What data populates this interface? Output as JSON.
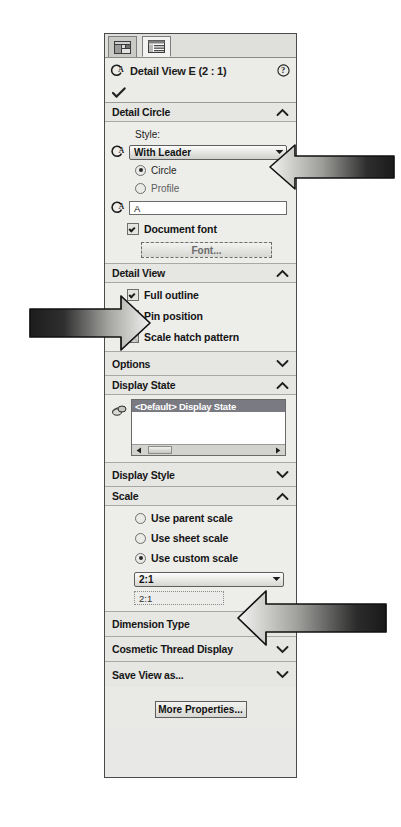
{
  "window": {
    "title": "Detail View E (2 : 1)"
  },
  "tabs": [
    {
      "name": "property-manager-tab",
      "icon": "property-manager-icon",
      "active": false
    },
    {
      "name": "configuration-manager-tab",
      "icon": "list-table-icon",
      "active": true
    }
  ],
  "titlebar": {
    "icon": "detail-view-icon",
    "title": "Detail View E (2 : 1)",
    "help_icon": "help-question-icon"
  },
  "ok_button": {
    "icon": "checkmark-icon",
    "label": "OK"
  },
  "sections": {
    "detail_circle": {
      "label": "Detail Circle",
      "expanded": true,
      "chevron": "chevron-up-icon",
      "style_label": "Style:",
      "style_value": "With Leader",
      "style_icon": "detail-circle-icon",
      "radio_circle": "Circle",
      "radio_profile": "Profile",
      "radio_selected": "Circle",
      "label_field_icon": "detail-label-icon",
      "label_field_value": "A",
      "document_font_label": "Document font",
      "document_font_checked": true,
      "font_button": "Font..."
    },
    "detail_view": {
      "label": "Detail View",
      "expanded": true,
      "chevron": "chevron-up-icon",
      "full_outline_label": "Full outline",
      "full_outline_checked": true,
      "pin_position_label": "Pin position",
      "pin_position_checked": true,
      "scale_hatch_label": "Scale hatch pattern",
      "scale_hatch_checked": false
    },
    "options": {
      "label": "Options",
      "expanded": false,
      "chevron": "chevron-down-icon"
    },
    "display_state": {
      "label": "Display State",
      "expanded": true,
      "chevron": "chevron-up-icon",
      "icon": "display-state-icon",
      "selected_item": "<Default> Display State",
      "scroll_left_icon": "scroll-left-arrow-icon",
      "scroll_right_icon": "scroll-right-arrow-icon"
    },
    "display_style": {
      "label": "Display Style",
      "expanded": false,
      "chevron": "chevron-down-icon"
    },
    "scale": {
      "label": "Scale",
      "expanded": true,
      "chevron": "chevron-up-icon",
      "use_parent_scale": "Use parent scale",
      "use_sheet_scale": "Use sheet scale",
      "use_custom_scale": "Use custom scale",
      "selected": "Use custom scale",
      "scale_combo_value": "2:1",
      "scale_text_value": "2:1"
    },
    "dimension_type": {
      "label": "Dimension Type",
      "expanded": false,
      "chevron": "chevron-down-icon"
    },
    "cosmetic_thread_display": {
      "label": "Cosmetic Thread Display",
      "expanded": false,
      "chevron": "chevron-down-icon"
    },
    "save_view_as": {
      "label": "Save View as...",
      "expanded": false,
      "chevron": "chevron-down-icon"
    }
  },
  "footer": {
    "more_properties_label": "More Properties..."
  },
  "annotations": [
    {
      "name": "callout-arrow-style-dropdown",
      "direction": "left",
      "target": "style-combobox"
    },
    {
      "name": "callout-arrow-detail-view-section",
      "direction": "right",
      "target": "detail-view-section"
    },
    {
      "name": "callout-arrow-scale-dropdown",
      "direction": "left",
      "target": "scale-combobox"
    }
  ],
  "colors": {
    "panel_bg": "#e8e8e6",
    "section_header_bg": "#e6e6e3",
    "selection_bg": "#7a7a82",
    "border": "#4a4a4a"
  }
}
